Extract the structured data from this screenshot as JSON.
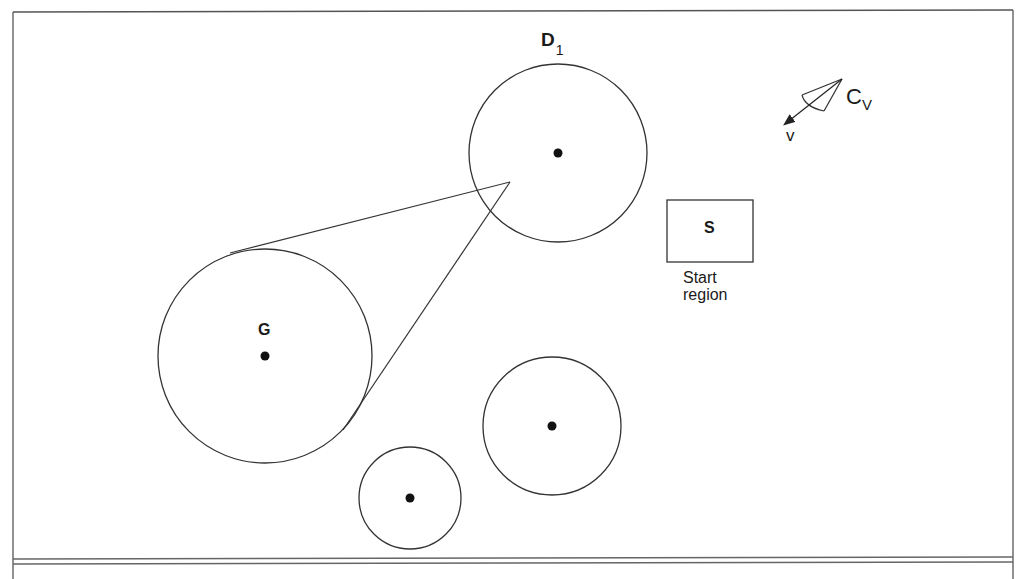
{
  "diagram": {
    "frame": {
      "stroke": "#555555"
    },
    "labels": {
      "d1_main": "D",
      "d1_sub": "1",
      "goal": "G",
      "start_box": "S",
      "start_caption_line1": "Start",
      "start_caption_line2": "region",
      "cv_main": "C",
      "cv_sub": "V",
      "velocity": "v"
    },
    "circles": [
      {
        "name": "goal-region-G",
        "cx": 265,
        "cy": 356,
        "r": 107
      },
      {
        "name": "obstacle-D1",
        "cx": 558,
        "cy": 153,
        "r": 89
      },
      {
        "name": "obstacle-medium",
        "cx": 552,
        "cy": 426,
        "r": 69
      },
      {
        "name": "obstacle-small",
        "cx": 410,
        "cy": 498,
        "r": 51
      }
    ],
    "start_region": {
      "x": 667,
      "y": 200,
      "w": 86,
      "h": 62
    },
    "cone": {
      "apex": [
        510,
        182
      ],
      "left_tangent": [
        230,
        253
      ],
      "right_tangent": [
        343,
        430
      ]
    },
    "velocity_cone": {
      "apex": [
        842,
        79
      ],
      "edge_a": [
        802,
        95
      ],
      "edge_b": [
        824,
        111
      ],
      "arrow_tip": [
        783,
        125
      ]
    },
    "colors": {
      "line": "#333333",
      "dot": "#111111",
      "background": "#ffffff"
    }
  }
}
